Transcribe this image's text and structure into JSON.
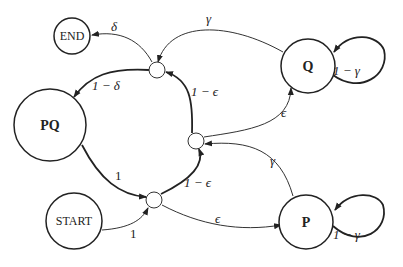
{
  "nodes": {
    "end": {
      "label": "END"
    },
    "pq": {
      "label": "PQ"
    },
    "start": {
      "label": "START"
    },
    "q": {
      "label": "Q"
    },
    "p": {
      "label": "P"
    }
  },
  "edges": {
    "junction_top_to_end": "δ",
    "junction_top_to_pq": "1 − δ",
    "q_to_junction_top": "γ",
    "q_self_loop": "1 − γ",
    "junction_mid_to_junction_top": "1 − ϵ",
    "junction_mid_to_q": "ϵ",
    "p_to_junction_mid": "γ",
    "pq_to_junction_bottom": "1",
    "start_to_junction_bottom": "1",
    "junction_bottom_to_junction_mid": "1 − ϵ",
    "junction_bottom_to_p": "ϵ",
    "p_self_loop": "1 − γ"
  }
}
